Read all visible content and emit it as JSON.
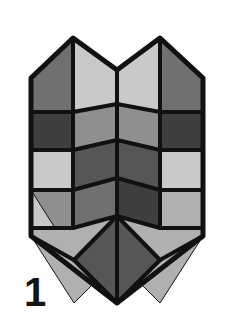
{
  "figure": {
    "label": "1",
    "caption_number": "1",
    "shape_name": "chevron-tiled-shield",
    "background_color": "#ffffff",
    "outline_color": "#111111",
    "outline_width": 4,
    "palette": {
      "very_light": "#c9c9c9",
      "light": "#b0b0b0",
      "medium": "#8f8f8f",
      "medium_dark": "#707070",
      "dark": "#565656",
      "very_dark": "#3f3f3f"
    },
    "outline_points": "73,38 117,70 160,38 203,78 203,236 117,303 31,236 31,78",
    "facets": [
      {
        "id": "f01",
        "name": "top-left-outer-upper",
        "tone": "medium_dark",
        "points": "31,78 73,38 73,112 31,112"
      },
      {
        "id": "f02",
        "name": "top-left-inner-upper",
        "tone": "very_light",
        "points": "73,38 117,70 117,104 73,112"
      },
      {
        "id": "f03",
        "name": "top-right-inner-upper",
        "tone": "very_light",
        "points": "117,70 160,38 160,112 117,104"
      },
      {
        "id": "f04",
        "name": "top-right-outer-upper",
        "tone": "medium_dark",
        "points": "160,38 203,78 203,112 160,112"
      },
      {
        "id": "f05",
        "name": "row2-left-outer",
        "tone": "very_dark",
        "points": "31,112 73,112 73,150 31,150"
      },
      {
        "id": "f06",
        "name": "row2-left-inner",
        "tone": "medium",
        "points": "73,112 117,104 117,140 73,150"
      },
      {
        "id": "f07",
        "name": "row2-right-inner",
        "tone": "medium",
        "points": "117,104 160,112 160,150 117,140"
      },
      {
        "id": "f08",
        "name": "row2-right-outer",
        "tone": "very_dark",
        "points": "160,112 203,112 203,150 160,150"
      },
      {
        "id": "f09",
        "name": "row3-left-outer",
        "tone": "very_light",
        "points": "31,150 73,150 73,190 31,190"
      },
      {
        "id": "f10",
        "name": "row3-left-inner",
        "tone": "dark",
        "points": "73,150 117,140 117,178 73,190"
      },
      {
        "id": "f11",
        "name": "row3-right-inner",
        "tone": "dark",
        "points": "117,140 160,150 160,190 117,178"
      },
      {
        "id": "f12",
        "name": "row3-right-outer",
        "tone": "very_light",
        "points": "160,150 203,150 203,190 160,190"
      },
      {
        "id": "f13",
        "name": "row4-left-outer",
        "tone": "medium",
        "points": "31,190 73,190 73,228 31,228"
      },
      {
        "id": "f14",
        "name": "row4-left-inner",
        "tone": "medium_dark",
        "points": "73,190 117,178 117,216 73,228"
      },
      {
        "id": "f15",
        "name": "row4-right-inner",
        "tone": "very_dark",
        "points": "117,178 160,190 160,228 117,216"
      },
      {
        "id": "f16",
        "name": "row4-right-outer",
        "tone": "light",
        "points": "160,190 203,190 203,228 160,228"
      },
      {
        "id": "f17",
        "name": "bottom-left-corner",
        "tone": "very_light",
        "points": "31,190 31,236 60,236 31,190"
      },
      {
        "id": "f18",
        "name": "bottom-left-diamond",
        "tone": "light",
        "points": "31,228 73,228 117,216 117,260 74,303 31,236"
      },
      {
        "id": "f19",
        "name": "bottom-right-diamond",
        "tone": "light",
        "points": "117,216 160,228 203,228 203,236 160,303 117,260"
      },
      {
        "id": "f20",
        "name": "bottom-center-diamond",
        "tone": "dark",
        "points": "117,216 160,260 117,303 74,260"
      }
    ],
    "seams": [
      {
        "name": "center-vertical-seam",
        "path": "M117,70 L117,303"
      },
      {
        "name": "left-vertical-seam",
        "path": "M73,38 L73,228"
      },
      {
        "name": "right-vertical-seam",
        "path": "M160,38 L160,228"
      },
      {
        "name": "chevron-row1",
        "path": "M31,112 L73,112 L117,104 L160,112 L203,112"
      },
      {
        "name": "chevron-row2",
        "path": "M31,150 L73,150 L117,140 L160,150 L203,150"
      },
      {
        "name": "chevron-row3",
        "path": "M31,190 L73,190 L117,178 L160,190 L203,190"
      },
      {
        "name": "chevron-row4",
        "path": "M31,228 L73,228 L117,216 L160,228 L203,228"
      },
      {
        "name": "bottom-left-diagonal",
        "path": "M117,216 L74,260 L31,236"
      },
      {
        "name": "bottom-right-diagonal",
        "path": "M117,216 L160,260 L203,236"
      },
      {
        "name": "bottom-point-left",
        "path": "M74,260 L117,303"
      },
      {
        "name": "bottom-point-right",
        "path": "M160,260 L117,303"
      }
    ]
  }
}
